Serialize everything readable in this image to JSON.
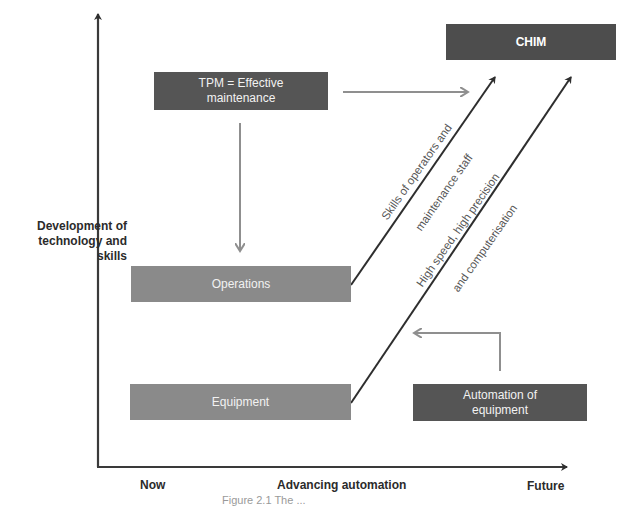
{
  "diagram": {
    "y_axis_label": "Development of technology and skills",
    "y_axis_label_lines": [
      "Development of",
      "technology and",
      "skills"
    ],
    "x_axis_label": "Advancing automation",
    "x_axis_start": "Now",
    "x_axis_end": "Future",
    "boxes": {
      "chim": "CHIM",
      "tpm_line1": "TPM = Effective",
      "tpm_line2": "maintenance",
      "operations": "Operations",
      "equipment": "Equipment",
      "automation_line1": "Automation of",
      "automation_line2": "equipment"
    },
    "diagonal_labels": {
      "skills_line1": "Skills of operators and",
      "skills_line2": "maintenance staff",
      "speed_line1": "High speed, high precision",
      "speed_line2": "and computerisation"
    },
    "caption_partial": "Figure 2.1 The ...",
    "colors": {
      "axis": "#3a3a3a",
      "box_dark": "#555555",
      "box_mid": "#8a8a8a",
      "chim_box": "#4d4d4d",
      "light_arrow": "#8f8f8f",
      "dark_arrow": "#2e2e2e"
    }
  }
}
